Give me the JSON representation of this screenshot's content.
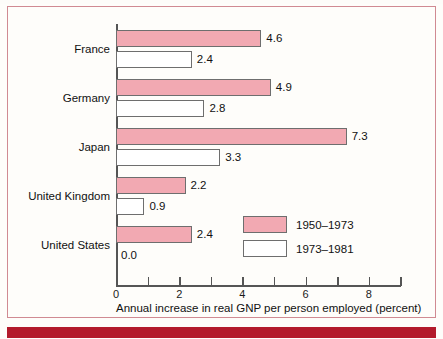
{
  "figure": {
    "frame_border_color": "#d08a92",
    "accent_rule_color": "#b31a2b",
    "series_colors": [
      "#f2a9b2",
      "#ffffff"
    ]
  },
  "chart_data": {
    "type": "bar",
    "orientation": "horizontal",
    "title": "",
    "xlabel": "Annual increase in real GNP per person employed (percent)",
    "ylabel": "",
    "categories": [
      "France",
      "Germany",
      "Japan",
      "United Kingdom",
      "United States"
    ],
    "series": [
      {
        "name": "1950–1973",
        "color": "#f2a9b2",
        "values": [
          4.6,
          4.9,
          7.3,
          2.2,
          2.4
        ],
        "labels": [
          "4.6",
          "4.9",
          "7.3",
          "2.2",
          "2.4"
        ]
      },
      {
        "name": "1973–1981",
        "color": "#ffffff",
        "values": [
          2.4,
          2.8,
          3.3,
          0.9,
          0.0
        ],
        "labels": [
          "2.4",
          "2.8",
          "3.3",
          "0.9",
          "0.0"
        ]
      }
    ],
    "xlim": [
      0,
      9
    ],
    "xticks": [
      0,
      1,
      2,
      3,
      4,
      5,
      6,
      7,
      8,
      9
    ],
    "xticklabels": [
      "0",
      "",
      "2",
      "",
      "4",
      "",
      "6",
      "",
      "8",
      ""
    ],
    "grid": false,
    "legend_position": "inside-lower-right",
    "legend": [
      "1950–1973",
      "1973–1981"
    ]
  }
}
